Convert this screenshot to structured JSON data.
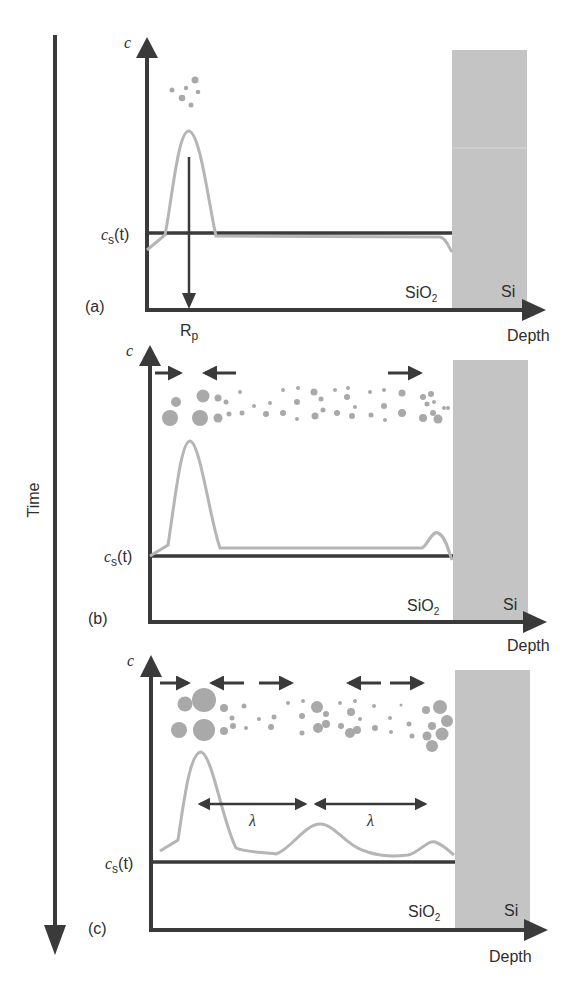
{
  "time_axis": {
    "label": "Time"
  },
  "colors": {
    "axis": "#3a3a3a",
    "curve": "#b5b5b5",
    "particle": "#a9a9a9",
    "si_block": "#c4c4c4",
    "text": "#2e2e2e"
  },
  "panels": [
    {
      "id": "a",
      "label": "(a)",
      "y_label": "c",
      "cs_label": "c",
      "cs_sub": "s",
      "cs_arg": "(t)",
      "oxide_label": "SiO",
      "oxide_sub": "2",
      "si_label": "Si",
      "x_label": "Depth",
      "rp_label": "R",
      "rp_sub": "p"
    },
    {
      "id": "b",
      "label": "(b)",
      "y_label": "c",
      "cs_label": "c",
      "cs_sub": "s",
      "cs_arg": "(t)",
      "oxide_label": "SiO",
      "oxide_sub": "2",
      "si_label": "Si",
      "x_label": "Depth"
    },
    {
      "id": "c",
      "label": "(c)",
      "y_label": "c",
      "cs_label": "c",
      "cs_sub": "s",
      "cs_arg": "(t)",
      "oxide_label": "SiO",
      "oxide_sub": "2",
      "si_label": "Si",
      "x_label": "Depth",
      "lambda_1": "λ",
      "lambda_2": "λ"
    }
  ]
}
